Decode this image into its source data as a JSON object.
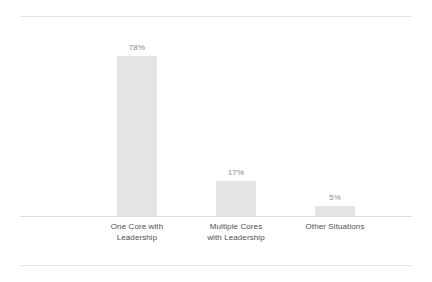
{
  "chart_data": {
    "type": "bar",
    "title": "",
    "subtitle": "",
    "xlabel": "",
    "ylabel": "",
    "ylim": [
      0,
      100
    ],
    "grid": false,
    "legend": null,
    "axis_baseline_visible": true,
    "value_label_suffix": "%",
    "categories": [
      "One Core with Leadership",
      "Multiple Cores with Leadership",
      "Other Situations"
    ],
    "category_lines": [
      [
        "One Core with",
        "Leadership"
      ],
      [
        "Multiple Cores",
        "with Leadership"
      ],
      [
        "Other Situations",
        ""
      ]
    ],
    "values": [
      78,
      17,
      5
    ],
    "value_labels": [
      "78%",
      "17%",
      "5%"
    ],
    "colors": {
      "bar_fill": "#e4e4e4",
      "value_label": "#8a8a8a",
      "category_label": "#4f4f4f",
      "rule": "#e2e2e2",
      "axis": "#dcdcdc",
      "background": "#ffffff"
    }
  }
}
